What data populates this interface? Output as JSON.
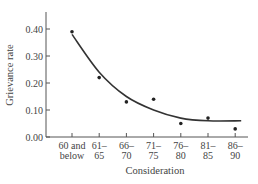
{
  "chart_data": {
    "type": "scatter",
    "title": "",
    "xlabel": "Consideration",
    "ylabel": "Grievance rate",
    "categories": [
      [
        "60 and",
        "below"
      ],
      [
        "61–",
        "65"
      ],
      [
        "66–",
        "70"
      ],
      [
        "71–",
        "75"
      ],
      [
        "76–",
        "80"
      ],
      [
        "81–",
        "85"
      ],
      [
        "86–",
        "90"
      ]
    ],
    "category_labels": [
      "60 and below",
      "61–65",
      "66–70",
      "71–75",
      "76–80",
      "81–85",
      "86–90"
    ],
    "series": [
      {
        "name": "Observed grievance rate",
        "values": [
          0.39,
          0.22,
          0.13,
          0.14,
          0.05,
          0.07,
          0.03
        ]
      }
    ],
    "fitted_curve": {
      "name": "Fitted trend",
      "values": [
        0.38,
        0.24,
        0.15,
        0.1,
        0.07,
        0.06,
        0.06
      ]
    },
    "yticks": [
      "0.00",
      "0.10",
      "0.20",
      "0.30",
      "0.40"
    ],
    "ylim": [
      0,
      0.46
    ],
    "grid": false,
    "legend": "none"
  }
}
